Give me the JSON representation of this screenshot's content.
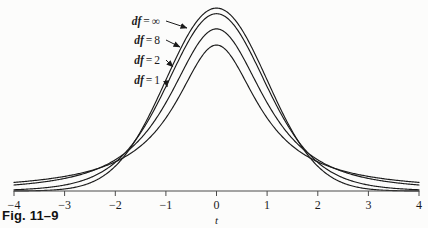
{
  "figure": {
    "caption": "Fig. 11–9",
    "background_color": "#fcfcfb",
    "ink_color": "#1b1b1b"
  },
  "chart_data": {
    "type": "line",
    "title": "",
    "subtitle": "",
    "xlabel": "t",
    "ylabel": "",
    "xlim": [
      -4,
      4
    ],
    "ylim": [
      0,
      0.41
    ],
    "grid": false,
    "legend_position": "inside-upper-left",
    "x_ticks": [
      -4,
      -3,
      -2,
      -1,
      0,
      1,
      2,
      3,
      4
    ],
    "x_tick_labels": [
      "−4",
      "−3",
      "−2",
      "−1",
      "0",
      "1",
      "2",
      "3",
      "4"
    ],
    "y_ticks": [],
    "y_tick_labels": [],
    "annotations": [
      {
        "text": "df = ∞",
        "df_symbol": "∞",
        "points_to_series": "df = ∞"
      },
      {
        "text": "df = 8",
        "df_symbol": "8",
        "points_to_series": "df = 8"
      },
      {
        "text": "df = 2",
        "df_symbol": "2",
        "points_to_series": "df = 2"
      },
      {
        "text": "df = 1",
        "df_symbol": "1",
        "points_to_series": "df = 1"
      }
    ],
    "series": [
      {
        "name": "df = ∞",
        "df": "infinity",
        "label_prefix": "df",
        "label_value": "∞",
        "color": "#1b1b1b",
        "peak_value": 0.3989,
        "label_y": 21,
        "arrow_tip_x": 187,
        "arrow_tip_y": 28,
        "x": [
          -4,
          -3.5,
          -3,
          -2.5,
          -2,
          -1.5,
          -1,
          -0.5,
          0,
          0.5,
          1,
          1.5,
          2,
          2.5,
          3,
          3.5,
          4
        ],
        "values": [
          0.0001,
          0.0009,
          0.0044,
          0.0175,
          0.054,
          0.1295,
          0.242,
          0.3521,
          0.3989,
          0.3521,
          0.242,
          0.1295,
          0.054,
          0.0175,
          0.0044,
          0.0009,
          0.0001
        ]
      },
      {
        "name": "df = 8",
        "df": 8,
        "label_prefix": "df",
        "label_value": "8",
        "color": "#1b1b1b",
        "peak_value": 0.3867,
        "label_y": 40,
        "arrow_tip_x": 180,
        "arrow_tip_y": 47,
        "x": [
          -4,
          -3.5,
          -3,
          -2.5,
          -2,
          -1.5,
          -1,
          -0.5,
          0,
          0.5,
          1,
          1.5,
          2,
          2.5,
          3,
          3.5,
          4
        ],
        "values": [
          0.0051,
          0.0092,
          0.0173,
          0.0332,
          0.0648,
          0.1269,
          0.2304,
          0.3397,
          0.3867,
          0.3397,
          0.2304,
          0.1269,
          0.0648,
          0.0332,
          0.0173,
          0.0092,
          0.0051
        ]
      },
      {
        "name": "df = 2",
        "df": 2,
        "label_prefix": "df",
        "label_value": "2",
        "color": "#1b1b1b",
        "peak_value": 0.3536,
        "label_y": 60,
        "arrow_tip_x": 173,
        "arrow_tip_y": 67,
        "x": [
          -4,
          -3.5,
          -3,
          -2.5,
          -2,
          -1.5,
          -1,
          -0.5,
          0,
          0.5,
          1,
          1.5,
          2,
          2.5,
          3,
          3.5,
          4
        ],
        "values": [
          0.0131,
          0.0189,
          0.0274,
          0.0422,
          0.068,
          0.12,
          0.1925,
          0.3062,
          0.3536,
          0.3062,
          0.1925,
          0.12,
          0.068,
          0.0422,
          0.0274,
          0.0189,
          0.0131
        ]
      },
      {
        "name": "df = 1",
        "df": 1,
        "label_prefix": "df",
        "label_value": "1",
        "color": "#1b1b1b",
        "peak_value": 0.3183,
        "label_y": 80,
        "arrow_tip_x": 167,
        "arrow_tip_y": 87,
        "x": [
          -4,
          -3.5,
          -3,
          -2.5,
          -2,
          -1.5,
          -1,
          -0.5,
          0,
          0.5,
          1,
          1.5,
          2,
          2.5,
          3,
          3.5,
          4
        ],
        "values": [
          0.0187,
          0.0239,
          0.0318,
          0.0439,
          0.0637,
          0.0979,
          0.1592,
          0.2546,
          0.3183,
          0.2546,
          0.1592,
          0.0979,
          0.0637,
          0.0439,
          0.0318,
          0.0239,
          0.0187
        ]
      }
    ]
  },
  "axis": {
    "name": "t",
    "line_y": 191,
    "left_x": 14,
    "right_x": 419,
    "tick_length": 5
  }
}
